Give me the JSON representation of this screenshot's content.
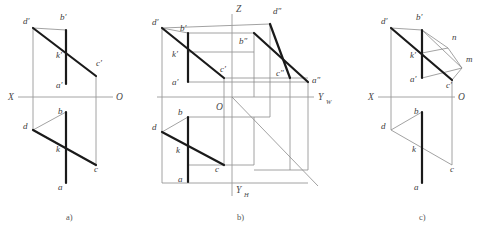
{
  "figure": {
    "captions": [
      {
        "id": "cap-a",
        "text": "a)",
        "x": 66,
        "y": 220
      },
      {
        "id": "cap-b",
        "text": "b)",
        "x": 237,
        "y": 220
      },
      {
        "id": "cap-c",
        "text": "c)",
        "x": 419,
        "y": 220
      }
    ],
    "colors": {
      "thin_line": "#8a8a8a",
      "axis_line": "#9a9a9a",
      "thick_line": "#1a1a1a",
      "label_text": "#3b3b3b",
      "background": "#ffffff"
    }
  },
  "panel_a": {
    "name": "panel-a",
    "axes": [
      {
        "id": "x-axis",
        "label": "X",
        "label_x": 8,
        "label_y": 100,
        "x1": 18,
        "y1": 97,
        "x2": 113,
        "y2": 97
      },
      {
        "id": "o-origin",
        "label": "O",
        "label_x": 116,
        "label_y": 100
      }
    ],
    "points": [
      {
        "id": "d-prime",
        "label": "d′",
        "lx": 23,
        "ly": 24,
        "px": 33,
        "py": 28
      },
      {
        "id": "b-prime",
        "label": "b′",
        "lx": 60,
        "ly": 20,
        "px": 66,
        "py": 30
      },
      {
        "id": "k-prime",
        "label": "k′",
        "lx": 56,
        "ly": 58,
        "px": 66,
        "py": 53
      },
      {
        "id": "c-prime",
        "label": "c′",
        "lx": 96,
        "ly": 66,
        "px": 96,
        "py": 76
      },
      {
        "id": "a-prime",
        "label": "a′",
        "lx": 56,
        "ly": 88,
        "px": 66,
        "py": 84
      },
      {
        "id": "b-point",
        "label": "b",
        "lx": 58,
        "ly": 114,
        "px": 66,
        "py": 112
      },
      {
        "id": "d-point",
        "label": "d",
        "lx": 23,
        "ly": 129,
        "px": 33,
        "py": 130
      },
      {
        "id": "k-point",
        "label": "k",
        "lx": 56,
        "ly": 152,
        "px": 66,
        "py": 148
      },
      {
        "id": "c-point",
        "label": "c",
        "lx": 94,
        "ly": 172,
        "px": 96,
        "py": 165
      },
      {
        "id": "a-point",
        "label": "a",
        "lx": 58,
        "ly": 190,
        "px": 66,
        "py": 183
      }
    ],
    "thick_segments": [
      {
        "id": "seg-dprime-cprime",
        "x1": 33,
        "y1": 28,
        "x2": 96,
        "y2": 76
      },
      {
        "id": "seg-ab-vertical-top",
        "x1": 66,
        "y1": 30,
        "x2": 66,
        "y2": 84
      },
      {
        "id": "seg-d-c",
        "x1": 33,
        "y1": 130,
        "x2": 96,
        "y2": 165
      },
      {
        "id": "seg-ab-vertical-bottom",
        "x1": 66,
        "y1": 112,
        "x2": 66,
        "y2": 183
      }
    ],
    "thin_segments": [
      {
        "id": "proj-d",
        "x1": 33,
        "y1": 28,
        "x2": 33,
        "y2": 130
      },
      {
        "id": "proj-c",
        "x1": 96,
        "y1": 76,
        "x2": 96,
        "y2": 165
      },
      {
        "id": "edge-dprime-bprime",
        "x1": 33,
        "y1": 28,
        "x2": 66,
        "y2": 30
      },
      {
        "id": "edge-d-b",
        "x1": 33,
        "y1": 130,
        "x2": 66,
        "y2": 112
      }
    ]
  },
  "panel_b": {
    "name": "panel-b",
    "axes": [
      {
        "id": "z-axis",
        "label": "Z",
        "label_x": 236,
        "label_y": 12,
        "x1": 232,
        "y1": 14,
        "x2": 232,
        "y2": 196
      },
      {
        "id": "yw-axis",
        "label": "Y",
        "sub": "W",
        "label_x": 318,
        "label_y": 100,
        "sub_x": 326,
        "sub_y": 104,
        "x1": 157,
        "y1": 97,
        "x2": 314,
        "y2": 97
      },
      {
        "id": "yh-axis",
        "label": "Y",
        "sub": "H",
        "label_x": 236,
        "label_y": 193,
        "sub_x": 244,
        "sub_y": 197
      },
      {
        "id": "o-origin",
        "label": "O",
        "label_x": 216,
        "label_y": 110
      },
      {
        "id": "bisector",
        "x1": 232,
        "y1": 97,
        "x2": 318,
        "y2": 186
      }
    ],
    "points": [
      {
        "id": "d-prime",
        "label": "d′",
        "lx": 152,
        "ly": 25,
        "px": 162,
        "py": 28
      },
      {
        "id": "b-prime",
        "label": "b′",
        "lx": 180,
        "ly": 31,
        "px": 188,
        "py": 33
      },
      {
        "id": "k-prime",
        "label": "k′",
        "lx": 172,
        "ly": 57,
        "px": 188,
        "py": 53
      },
      {
        "id": "c-prime",
        "label": "c′",
        "lx": 220,
        "ly": 72,
        "px": 224,
        "py": 78
      },
      {
        "id": "a-prime",
        "label": "a′",
        "lx": 172,
        "ly": 85,
        "px": 188,
        "py": 82
      },
      {
        "id": "d-double-prime",
        "label": "d″",
        "lx": 273,
        "ly": 14,
        "px": 270,
        "py": 24
      },
      {
        "id": "b-double-prime",
        "label": "b″",
        "lx": 239,
        "ly": 44,
        "px": 254,
        "py": 33
      },
      {
        "id": "c-double-prime",
        "label": "c″",
        "lx": 276,
        "ly": 76,
        "px": 290,
        "py": 78
      },
      {
        "id": "a-double-prime",
        "label": "a″",
        "lx": 312,
        "ly": 83,
        "px": 308,
        "py": 82
      },
      {
        "id": "b-point",
        "label": "b",
        "lx": 178,
        "ly": 115,
        "px": 188,
        "py": 117
      },
      {
        "id": "d-point",
        "label": "d",
        "lx": 152,
        "ly": 130,
        "px": 162,
        "py": 132
      },
      {
        "id": "k-point",
        "label": "k",
        "lx": 176,
        "ly": 153,
        "px": 188,
        "py": 148
      },
      {
        "id": "c-point",
        "label": "c",
        "lx": 215,
        "ly": 172,
        "px": 224,
        "py": 165
      },
      {
        "id": "a-point",
        "label": "a",
        "lx": 178,
        "ly": 182,
        "px": 188,
        "py": 182
      }
    ],
    "thick_segments": [
      {
        "id": "seg-dprime-cprime",
        "x1": 162,
        "y1": 28,
        "x2": 224,
        "y2": 78
      },
      {
        "id": "seg-ab-vertical-top",
        "x1": 188,
        "y1": 33,
        "x2": 188,
        "y2": 82
      },
      {
        "id": "seg-d-c",
        "x1": 162,
        "y1": 132,
        "x2": 224,
        "y2": 165
      },
      {
        "id": "seg-ab-vertical-bottom",
        "x1": 188,
        "y1": 117,
        "x2": 188,
        "y2": 182
      },
      {
        "id": "seg-bdp-adp",
        "x1": 254,
        "y1": 33,
        "x2": 308,
        "y2": 82
      },
      {
        "id": "seg-ddp-cdp",
        "x1": 270,
        "y1": 24,
        "x2": 290,
        "y2": 78
      }
    ],
    "thin_segments": [
      {
        "id": "proj-d-vert",
        "x1": 162,
        "y1": 28,
        "x2": 162,
        "y2": 132
      },
      {
        "id": "edge-dprime-bprime",
        "x1": 162,
        "y1": 28,
        "x2": 188,
        "y2": 33
      },
      {
        "id": "edge-d-b",
        "x1": 162,
        "y1": 132,
        "x2": 188,
        "y2": 117
      },
      {
        "id": "box-top-1",
        "x1": 162,
        "y1": 28,
        "x2": 270,
        "y2": 24
      },
      {
        "id": "box-top-2",
        "x1": 188,
        "y1": 33,
        "x2": 254,
        "y2": 33
      },
      {
        "id": "h-bprime-bdprime",
        "x1": 188,
        "y1": 52,
        "x2": 254,
        "y2": 52
      },
      {
        "id": "h-cprime-cdprime",
        "x1": 224,
        "y1": 78,
        "x2": 308,
        "y2": 78
      },
      {
        "id": "h-aprime-adprime",
        "x1": 188,
        "y1": 82,
        "x2": 308,
        "y2": 82
      },
      {
        "id": "v-ddp",
        "x1": 270,
        "y1": 24,
        "x2": 270,
        "y2": 97
      },
      {
        "id": "v-bdp",
        "x1": 254,
        "y1": 33,
        "x2": 254,
        "y2": 97
      },
      {
        "id": "v-cdp",
        "x1": 290,
        "y1": 78,
        "x2": 290,
        "y2": 97
      },
      {
        "id": "v-adp",
        "x1": 308,
        "y1": 82,
        "x2": 308,
        "y2": 170
      },
      {
        "id": "v-cprime-c",
        "x1": 224,
        "y1": 78,
        "x2": 224,
        "y2": 165
      },
      {
        "id": "plan-box-left",
        "x1": 162,
        "y1": 132,
        "x2": 162,
        "y2": 183
      },
      {
        "id": "plan-box-bottom",
        "x1": 162,
        "y1": 183,
        "x2": 308,
        "y2": 183
      },
      {
        "id": "plan-h-b",
        "x1": 188,
        "y1": 117,
        "x2": 270,
        "y2": 117
      },
      {
        "id": "plan-h-c",
        "x1": 188,
        "y1": 165,
        "x2": 254,
        "y2": 165
      },
      {
        "id": "plan-v-1",
        "x1": 270,
        "y1": 97,
        "x2": 270,
        "y2": 117
      },
      {
        "id": "plan-v-2",
        "x1": 254,
        "y1": 117,
        "x2": 254,
        "y2": 165
      },
      {
        "id": "plan-v-3",
        "x1": 290,
        "y1": 97,
        "x2": 290,
        "y2": 170
      },
      {
        "id": "plan-h-4",
        "x1": 254,
        "y1": 170,
        "x2": 308,
        "y2": 170
      },
      {
        "id": "h-far-right",
        "x1": 162,
        "y1": 28,
        "x2": 162,
        "y2": 28
      }
    ]
  },
  "panel_c": {
    "name": "panel-c",
    "axes": [
      {
        "id": "x-axis",
        "label": "X",
        "label_x": 368,
        "label_y": 100,
        "x1": 378,
        "y1": 97,
        "x2": 455,
        "y2": 97
      },
      {
        "id": "o-origin",
        "label": "O",
        "label_x": 458,
        "label_y": 100
      }
    ],
    "points": [
      {
        "id": "d-prime",
        "label": "d′",
        "lx": 381,
        "ly": 24,
        "px": 391,
        "py": 28
      },
      {
        "id": "b-prime",
        "label": "b′",
        "lx": 416,
        "ly": 20,
        "px": 422,
        "py": 30
      },
      {
        "id": "k-prime",
        "label": "k′",
        "lx": 410,
        "ly": 58,
        "px": 422,
        "py": 53
      },
      {
        "id": "a-prime",
        "label": "a′",
        "lx": 410,
        "ly": 82,
        "px": 422,
        "py": 78
      },
      {
        "id": "c-prime",
        "label": "c′",
        "lx": 446,
        "ly": 88,
        "px": 452,
        "py": 80
      },
      {
        "id": "n-point",
        "label": "n",
        "lx": 452,
        "ly": 40,
        "px": 448,
        "py": 48
      },
      {
        "id": "m-point",
        "label": "m",
        "lx": 466,
        "ly": 62,
        "px": 462,
        "py": 68
      },
      {
        "id": "b-point",
        "label": "b",
        "lx": 414,
        "ly": 114,
        "px": 422,
        "py": 112
      },
      {
        "id": "d-point",
        "label": "d",
        "lx": 381,
        "ly": 129,
        "px": 391,
        "py": 130
      },
      {
        "id": "k-point",
        "label": "k",
        "lx": 412,
        "ly": 152,
        "px": 422,
        "py": 148
      },
      {
        "id": "c-point",
        "label": "c",
        "lx": 450,
        "ly": 172,
        "px": 452,
        "py": 165
      },
      {
        "id": "a-point",
        "label": "a",
        "lx": 414,
        "ly": 190,
        "px": 422,
        "py": 183
      }
    ],
    "thick_segments": [
      {
        "id": "seg-dprime-cprime",
        "x1": 391,
        "y1": 28,
        "x2": 452,
        "y2": 80
      },
      {
        "id": "seg-ab-vertical-top",
        "x1": 422,
        "y1": 30,
        "x2": 422,
        "y2": 78
      },
      {
        "id": "seg-ab-vertical-bottom",
        "x1": 422,
        "y1": 112,
        "x2": 422,
        "y2": 183
      }
    ],
    "thin_segments": [
      {
        "id": "proj-d",
        "x1": 391,
        "y1": 28,
        "x2": 391,
        "y2": 130
      },
      {
        "id": "proj-c",
        "x1": 452,
        "y1": 80,
        "x2": 452,
        "y2": 165
      },
      {
        "id": "edge-dprime-bprime",
        "x1": 391,
        "y1": 28,
        "x2": 422,
        "y2": 30
      },
      {
        "id": "edge-d-b",
        "x1": 391,
        "y1": 130,
        "x2": 422,
        "y2": 112
      },
      {
        "id": "seg-d-c-thin",
        "x1": 391,
        "y1": 130,
        "x2": 452,
        "y2": 165
      },
      {
        "id": "seg-bprime-n",
        "x1": 422,
        "y1": 30,
        "x2": 448,
        "y2": 48
      },
      {
        "id": "seg-bprime-m",
        "x1": 422,
        "y1": 30,
        "x2": 462,
        "y2": 68
      },
      {
        "id": "seg-kprime-n",
        "x1": 422,
        "y1": 53,
        "x2": 448,
        "y2": 48
      },
      {
        "id": "seg-n-m",
        "x1": 448,
        "y1": 48,
        "x2": 462,
        "y2": 68
      },
      {
        "id": "seg-aprime-m",
        "x1": 422,
        "y1": 78,
        "x2": 462,
        "y2": 68
      },
      {
        "id": "seg-cprime-m",
        "x1": 452,
        "y1": 80,
        "x2": 462,
        "y2": 68
      }
    ]
  }
}
